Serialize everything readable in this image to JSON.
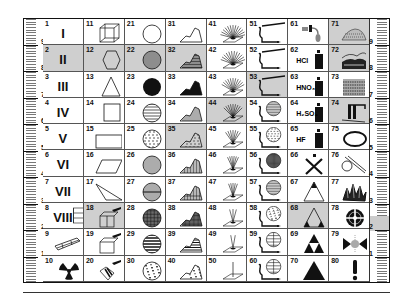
{
  "chart_title": "",
  "left_ruler": {
    "marks": [
      "9",
      "8",
      "7",
      "6",
      "5",
      "4",
      "3",
      "2",
      "1"
    ]
  },
  "right_ruler": {
    "marks": [
      "9",
      "8",
      "7",
      "6",
      "5",
      "4",
      "3",
      "2",
      "1"
    ]
  },
  "columns": [
    {
      "cells": [
        {
          "n": "1",
          "label": "I",
          "symbol": "roman-1"
        },
        {
          "n": "2",
          "label": "II",
          "symbol": "roman-2",
          "shaded": true
        },
        {
          "n": "3",
          "label": "III",
          "symbol": "roman-3"
        },
        {
          "n": "4",
          "label": "IV",
          "symbol": "roman-4"
        },
        {
          "n": "5",
          "label": "V",
          "symbol": "roman-5"
        },
        {
          "n": "6",
          "label": "VI",
          "symbol": "roman-6"
        },
        {
          "n": "7",
          "label": "VII",
          "symbol": "roman-7"
        },
        {
          "n": "8",
          "label": "VIII",
          "symbol": "roman-8"
        },
        {
          "n": "9",
          "label": "",
          "symbol": "elongated-box"
        },
        {
          "n": "10",
          "label": "",
          "symbol": "radiation"
        }
      ]
    },
    {
      "cells": [
        {
          "n": "11",
          "label": "",
          "symbol": "cube"
        },
        {
          "n": "12",
          "label": "",
          "symbol": "hexagon",
          "shaded": true
        },
        {
          "n": "13",
          "label": "",
          "symbol": "triangle"
        },
        {
          "n": "14",
          "label": "",
          "symbol": "square"
        },
        {
          "n": "15",
          "label": "",
          "symbol": "rectangle"
        },
        {
          "n": "16",
          "label": "",
          "symbol": "parallelogram"
        },
        {
          "n": "17",
          "label": "",
          "symbol": "thin-triangle"
        },
        {
          "n": "18",
          "label": "",
          "symbol": "box-hammer",
          "shaded": true
        },
        {
          "n": "19",
          "label": "",
          "symbol": "box-hammer-open"
        },
        {
          "n": "20",
          "label": "",
          "symbol": "box-hammer-broken"
        }
      ]
    },
    {
      "cells": [
        {
          "n": "21",
          "label": "",
          "symbol": "circle-empty"
        },
        {
          "n": "22",
          "label": "",
          "symbol": "circle-hlines",
          "shaded": true
        },
        {
          "n": "23",
          "label": "",
          "symbol": "circle-filled"
        },
        {
          "n": "24",
          "label": "",
          "symbol": "circle-hlines-sparse"
        },
        {
          "n": "25",
          "label": "",
          "symbol": "circle-dashes"
        },
        {
          "n": "26",
          "label": "",
          "symbol": "circle-vlines"
        },
        {
          "n": "27",
          "label": "",
          "symbol": "circle-vlines-hline"
        },
        {
          "n": "28",
          "label": "",
          "symbol": "circle-grid"
        },
        {
          "n": "29",
          "label": "",
          "symbol": "circle-thick-hlines"
        },
        {
          "n": "30",
          "label": "",
          "symbol": "circle-texture"
        }
      ]
    },
    {
      "cells": [
        {
          "n": "31",
          "label": "",
          "symbol": "mound-empty"
        },
        {
          "n": "32",
          "label": "",
          "symbol": "mound-hatched",
          "shaded": true
        },
        {
          "n": "33",
          "label": "",
          "symbol": "mound-filled"
        },
        {
          "n": "34",
          "label": "",
          "symbol": "mound-hlines"
        },
        {
          "n": "35",
          "label": "",
          "symbol": "mound-dashes",
          "shaded": true
        },
        {
          "n": "36",
          "label": "",
          "symbol": "mound-vlines"
        },
        {
          "n": "37",
          "label": "",
          "symbol": "mound-vlines-hline"
        },
        {
          "n": "38",
          "label": "",
          "symbol": "mound-grid"
        },
        {
          "n": "39",
          "label": "",
          "symbol": "mound-thick-hlines"
        },
        {
          "n": "40",
          "label": "",
          "symbol": "mound-texture"
        }
      ]
    },
    {
      "cells": [
        {
          "n": "41",
          "label": "",
          "symbol": "fan-rays-dense"
        },
        {
          "n": "42",
          "label": "",
          "symbol": "fan-rays"
        },
        {
          "n": "43",
          "label": "",
          "symbol": "fan-rays-medium"
        },
        {
          "n": "44",
          "label": "",
          "symbol": "fan-rays-narrow",
          "shaded": true
        },
        {
          "n": "45",
          "label": "",
          "symbol": "fan-rays-few"
        },
        {
          "n": "46",
          "label": "",
          "symbol": "fan-rays-vertical"
        },
        {
          "n": "47",
          "label": "",
          "symbol": "fan-rays-five"
        },
        {
          "n": "48",
          "label": "",
          "symbol": "fan-rays-three"
        },
        {
          "n": "49",
          "label": "",
          "symbol": "fan-rays-two"
        },
        {
          "n": "50",
          "label": "",
          "symbol": "single-ray"
        }
      ]
    },
    {
      "cells": [
        {
          "n": "51",
          "label": "",
          "symbol": "pipe-long"
        },
        {
          "n": "52",
          "label": "",
          "symbol": "pipe-long"
        },
        {
          "n": "53",
          "label": "",
          "symbol": "pipe-long",
          "shaded": true
        },
        {
          "n": "54",
          "label": "",
          "symbol": "pipe-circle-hlines"
        },
        {
          "n": "55",
          "label": "",
          "symbol": "pipe-circle-dashes"
        },
        {
          "n": "56",
          "label": "",
          "symbol": "pipe-circle-grid"
        },
        {
          "n": "57",
          "label": "",
          "symbol": "pipe-circle-hlines"
        },
        {
          "n": "58",
          "label": "",
          "symbol": "pipe-circle-texture"
        },
        {
          "n": "59",
          "label": "",
          "symbol": "pipe-circle-globe"
        },
        {
          "n": "60",
          "label": "",
          "symbol": "pipe-circle-globe"
        }
      ]
    },
    {
      "cells": [
        {
          "n": "61",
          "label": "",
          "symbol": "dropper"
        },
        {
          "n": "62",
          "label": "HCl",
          "symbol": "bottle"
        },
        {
          "n": "63",
          "label": "HNO₃",
          "symbol": "bottle"
        },
        {
          "n": "64",
          "label": "H₂SO₄",
          "symbol": "bottle"
        },
        {
          "n": "65",
          "label": "HF",
          "symbol": "bottle"
        },
        {
          "n": "66",
          "label": "",
          "symbol": "cross-x"
        },
        {
          "n": "67",
          "label": "",
          "symbol": "triangle-top-filled"
        },
        {
          "n": "68",
          "label": "",
          "symbol": "triangle-corners-filled",
          "shaded": true
        },
        {
          "n": "69",
          "label": "",
          "symbol": "triforce"
        },
        {
          "n": "70",
          "label": "",
          "symbol": "triangle-filled"
        }
      ]
    },
    {
      "cells": [
        {
          "n": "71",
          "label": "",
          "symbol": "dotted-mound",
          "shaded": true
        },
        {
          "n": "72",
          "label": "",
          "symbol": "landscape",
          "shaded": true
        },
        {
          "n": "73",
          "label": "",
          "symbol": "layered-block"
        },
        {
          "n": "74",
          "label": "",
          "symbol": "columns-structure",
          "shaded": true
        },
        {
          "n": "75",
          "label": "",
          "symbol": "ring"
        },
        {
          "n": "76",
          "label": "",
          "symbol": "loop-tube"
        },
        {
          "n": "77",
          "label": "",
          "symbol": "crystals"
        },
        {
          "n": "78",
          "label": "",
          "symbol": "target-cross"
        },
        {
          "n": "79",
          "label": "",
          "symbol": "bowtie-spark"
        },
        {
          "n": "80",
          "label": "!",
          "symbol": "exclamation"
        }
      ]
    }
  ]
}
